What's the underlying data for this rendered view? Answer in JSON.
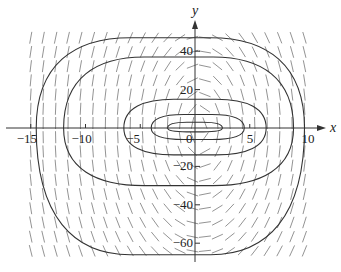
{
  "chart_data": {
    "type": "direction-field",
    "title": "",
    "xlabel": "x",
    "ylabel": "y",
    "xlim": [
      -16.5,
      11.5
    ],
    "ylim": [
      -70,
      55
    ],
    "grid": false,
    "x_ticks": [
      {
        "value": -15,
        "label": "−15"
      },
      {
        "value": -10,
        "label": "−10"
      },
      {
        "value": -5,
        "label": "−5"
      },
      {
        "value": 0,
        "label": "0"
      },
      {
        "value": 5,
        "label": "5"
      },
      {
        "value": 10,
        "label": "10"
      }
    ],
    "y_ticks": [
      {
        "value": 40,
        "label": "40"
      },
      {
        "value": 20,
        "label": "20"
      },
      {
        "value": -20,
        "label": "−20"
      },
      {
        "value": -40,
        "label": "−40"
      },
      {
        "value": -60,
        "label": "−60"
      }
    ],
    "field": {
      "x_range": [
        -15,
        10
      ],
      "y_range": [
        -64,
        47
      ],
      "description": "slope field arrows; rightward above x-axis, leftward below; clockwise circulation around an equilibrium near origin"
    },
    "trajectories": [
      {
        "name": "outer",
        "x_left": -14.5,
        "x_right": 10,
        "y_top": 47,
        "y_bottom": -66
      },
      {
        "name": "second",
        "x_left": -12,
        "x_right": 9,
        "y_top": 37,
        "y_bottom": -30
      },
      {
        "name": "third",
        "x_left": -6.5,
        "x_right": 6.5,
        "y_top": 15,
        "y_bottom": -14
      },
      {
        "name": "fourth",
        "x_left": -4,
        "x_right": 4.5,
        "y_top": 7,
        "y_bottom": -6
      },
      {
        "name": "inner",
        "x_left": -2.5,
        "x_right": 2.5,
        "y_top": 3,
        "y_bottom": -2
      }
    ]
  },
  "axes": {
    "x_label": "x",
    "y_label": "y"
  }
}
